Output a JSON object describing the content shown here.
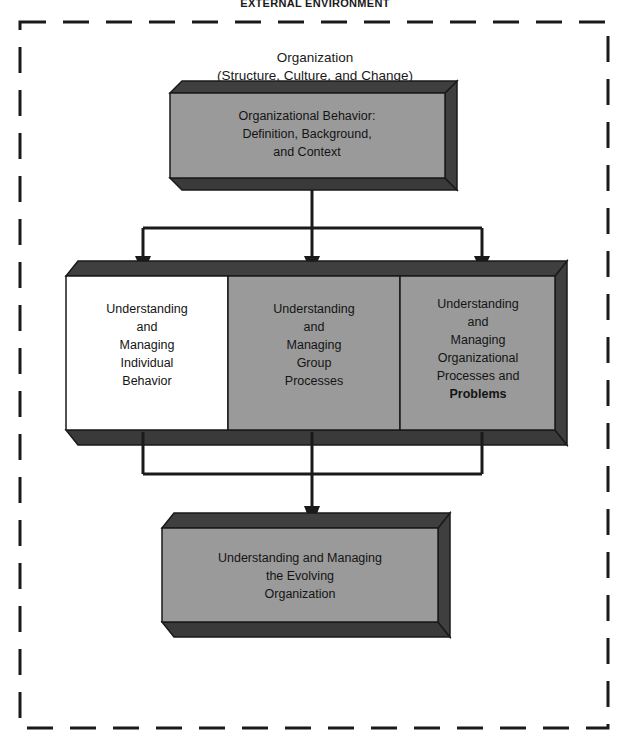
{
  "figure": {
    "environment_label": "EXTERNAL ENVIRONMENT",
    "organization_label_line1": "Organization",
    "organization_label_line2": "(Structure, Culture, and Change)"
  },
  "colors": {
    "box_face_gray": "#9a9a9a",
    "box_face_white": "#ffffff",
    "box_shadow_dark": "#3a3a3a",
    "box_side_dark": "#3f3f3f",
    "outline": "#1a1a1a",
    "arrow": "#1a1a1a",
    "border_dashed": "#1a1a1a",
    "text": "#141414",
    "background": "#ffffff"
  },
  "blocks": {
    "top": {
      "id": "organizational-behavior",
      "fill": "gray",
      "lines": [
        "Organizational Behavior:",
        "Definition, Background,",
        "and Context"
      ]
    },
    "middle": [
      {
        "id": "individual-behavior",
        "fill": "white",
        "lines": [
          "Understanding",
          "and",
          "Managing",
          "Individual",
          "Behavior"
        ]
      },
      {
        "id": "group-processes",
        "fill": "gray",
        "lines": [
          "Understanding",
          "and",
          "Managing",
          "Group",
          "Processes"
        ]
      },
      {
        "id": "organizational-processes",
        "fill": "gray",
        "lines": [
          "Understanding",
          "and",
          "Managing",
          "Organizational",
          "Processes and",
          "Problems"
        ]
      }
    ],
    "bottom": {
      "id": "evolving-organization",
      "fill": "gray",
      "lines": [
        "Understanding and Managing",
        "the Evolving",
        "Organization"
      ]
    }
  }
}
